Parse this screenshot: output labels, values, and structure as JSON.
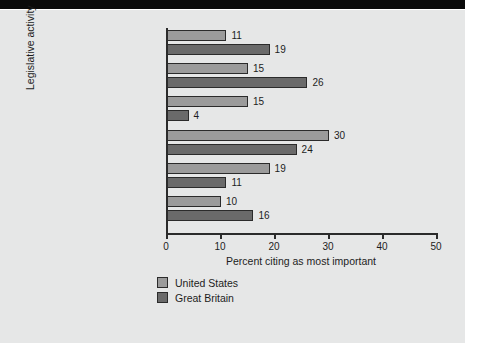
{
  "chart_data": {
    "type": "bar",
    "orientation": "horizontal",
    "title": "",
    "xlabel": "Percent citing as most important",
    "ylabel": "Legislative activity",
    "xlim": [
      0,
      50
    ],
    "xticks": [
      0,
      10,
      20,
      30,
      40,
      50
    ],
    "xtick_labels": [
      "0",
      "10",
      "20",
      "30",
      "40",
      "50"
    ],
    "grid": false,
    "legend_position": "bottom-left",
    "categories": [
      "Helping people",
      "Protecting district",
      "Oversight",
      "Keeping in touch with constituents",
      "Policymaking",
      "“Don’t know;” “all;” “none”"
    ],
    "category_lines": [
      [
        "Helping people"
      ],
      [
        "Protecting district"
      ],
      [
        "Oversight"
      ],
      [
        "Keeping in touch",
        "with constituents"
      ],
      [
        "Policymaking"
      ],
      [
        "“Don’t know;” “all;” “none”"
      ]
    ],
    "series": [
      {
        "name": "United States",
        "color": "#9b9b9b",
        "values": [
          11,
          15,
          15,
          30,
          19,
          10
        ]
      },
      {
        "name": "Great Britain",
        "color": "#6a6a6a",
        "values": [
          19,
          26,
          4,
          24,
          11,
          16
        ]
      }
    ]
  },
  "legend": {
    "items": [
      {
        "label": "United States",
        "key": "us"
      },
      {
        "label": "Great Britain",
        "key": "gb"
      }
    ]
  },
  "colors": {
    "united_states": "#9b9b9b",
    "great_britain": "#6a6a6a",
    "axis": "#2b2b2b",
    "paper": "#e6e7e7",
    "band": "#0a0a0a"
  }
}
